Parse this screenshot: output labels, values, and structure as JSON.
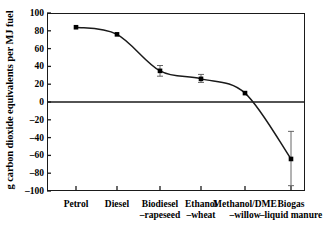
{
  "chart_data": {
    "type": "line",
    "title": "",
    "xlabel": "",
    "ylabel": "g carbon dioxide equivalents per MJ fuel",
    "categories": [
      "Petrol",
      "Biodiesel",
      "Diesel",
      "Ethanol",
      "Methanol/DME",
      "Biogas"
    ],
    "category_labels": [
      {
        "line1": "Petrol",
        "line2": ""
      },
      {
        "line1": "Diesel",
        "line2": ""
      },
      {
        "line1": "Biodiesel",
        "line2": "–rapeseed"
      },
      {
        "line1": "Ethanol",
        "line2": "–wheat"
      },
      {
        "line1": "Methanol/DME",
        "line2": "–willow"
      },
      {
        "line1": "Biogas",
        "line2": "–liquid manure"
      }
    ],
    "values": [
      84,
      76,
      35,
      26,
      10,
      -64
    ],
    "error_low": [
      84,
      76,
      29,
      22,
      10,
      -94
    ],
    "error_high": [
      84,
      76,
      41,
      31,
      10,
      -33
    ],
    "has_error_bars": [
      false,
      false,
      true,
      true,
      false,
      true
    ],
    "ylim": [
      -100,
      100
    ],
    "yticks": [
      100,
      80,
      60,
      40,
      20,
      0,
      -20,
      -40,
      -60,
      -80,
      -100
    ],
    "ytick_labels": [
      "100",
      "80",
      "60",
      "40",
      "20",
      "0",
      "–20",
      "–40",
      "–60",
      "–80",
      "–100"
    ],
    "grid": false,
    "legend": "none",
    "zero_line": true,
    "marker": "square",
    "line_color": "#1a1a1a",
    "marker_color": "#000000",
    "axis_color": "#1a1a1a",
    "background_color": "#ffffff"
  }
}
